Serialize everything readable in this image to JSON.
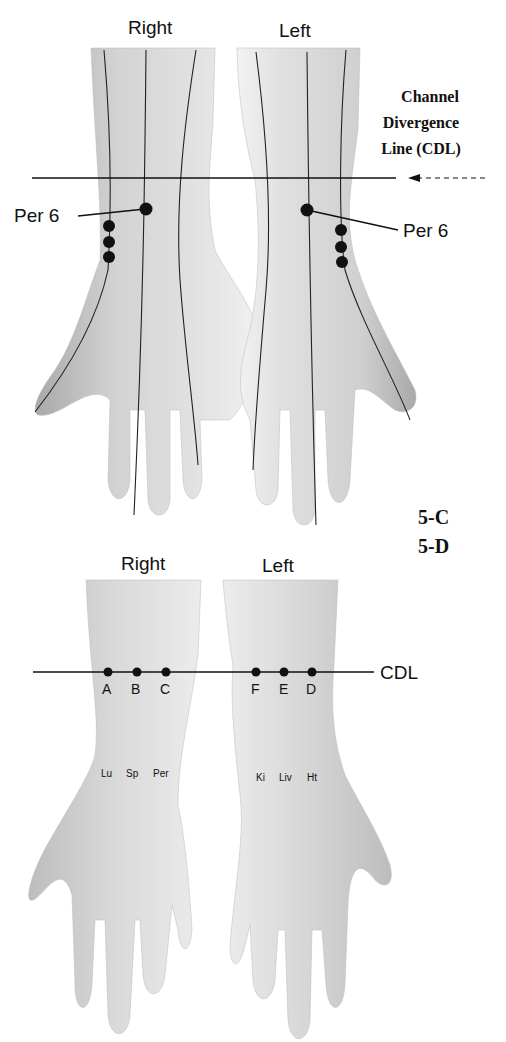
{
  "figure_top": {
    "id": "5-C",
    "hand_labels": {
      "right": "Right",
      "left": "Left"
    },
    "annotation": {
      "line1": "Channel",
      "line2": "Divergence",
      "line3": "Line (CDL)"
    },
    "points": {
      "right": "Per 6",
      "left": "Per 6"
    }
  },
  "figure_bottom": {
    "id": "5-D",
    "hand_labels": {
      "right": "Right",
      "left": "Left"
    },
    "line_label": "CDL",
    "right_points": [
      {
        "letter": "A",
        "organ": "Lu"
      },
      {
        "letter": "B",
        "organ": "Sp"
      },
      {
        "letter": "C",
        "organ": "Per"
      }
    ],
    "left_points": [
      {
        "letter": "F",
        "organ": "Ki"
      },
      {
        "letter": "E",
        "organ": "Liv"
      },
      {
        "letter": "D",
        "organ": "Ht"
      }
    ]
  },
  "colors": {
    "skin": "#d9d9d9",
    "skin_shadow": "#b8b8b8",
    "line": "#111111",
    "background": "#ffffff"
  }
}
